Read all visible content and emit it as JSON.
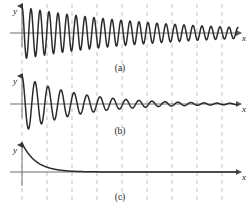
{
  "figure": {
    "width": 251,
    "height": 208,
    "background_color": "#ffffff",
    "curve_color": "#2b2b2b",
    "axis_color": "#4d4d4d",
    "grid_color": "#b9c6c6",
    "grid_dash": "4,4",
    "grid_x_positions": [
      22,
      47,
      72,
      97,
      122,
      147,
      172,
      197,
      222
    ],
    "grid_top": 4,
    "grid_bottom": 204
  },
  "labels": {
    "y_axis": "y",
    "x_axis": "x",
    "caption_a": "(a)",
    "caption_b": "(b)",
    "caption_c": "(c)"
  },
  "chart_data": {
    "type": "line",
    "xlabel": "x",
    "ylabel": "y",
    "grid": true,
    "legend": false,
    "panels": [
      {
        "id": "a",
        "caption": "(a)",
        "description": "lightly damped oscillation, slow exponential decay envelope",
        "baseline_y": 33,
        "x_start": 22,
        "x_end": 238,
        "amplitude": 26,
        "decay": 0.0072,
        "period_px": 9.0,
        "phase": 0,
        "xlim": [
          0,
          216
        ],
        "ylim": [
          -26,
          26
        ]
      },
      {
        "id": "b",
        "caption": "(b)",
        "description": "moderately damped oscillation, faster exponential decay envelope",
        "baseline_y": 104,
        "x_start": 22,
        "x_end": 238,
        "amplitude": 28,
        "decay": 0.0175,
        "period_px": 13.0,
        "phase": 0,
        "xlim": [
          0,
          216
        ],
        "ylim": [
          -28,
          28
        ]
      },
      {
        "id": "c",
        "caption": "(c)",
        "description": "overdamped, pure exponential decay with no oscillation",
        "baseline_y": 172,
        "x_start": 22,
        "x_end": 238,
        "amplitude": 29,
        "decay": 0.072,
        "period_px": 0,
        "phase": 0,
        "xlim": [
          0,
          216
        ],
        "ylim": [
          0,
          29
        ]
      }
    ],
    "axes": [
      {
        "panel": "a",
        "origin_x": 22,
        "baseline_y": 33,
        "y_top": 6,
        "x_right": 241
      },
      {
        "panel": "b",
        "origin_x": 22,
        "baseline_y": 104,
        "y_top": 76,
        "x_right": 241
      },
      {
        "panel": "c",
        "origin_x": 22,
        "baseline_y": 172,
        "y_top": 145,
        "x_right": 241
      }
    ],
    "caption_positions": [
      {
        "caption": "(a)",
        "x": 120,
        "y": 71
      },
      {
        "caption": "(b)",
        "x": 120,
        "y": 134
      },
      {
        "caption": "(c)",
        "x": 120,
        "y": 200
      }
    ],
    "y_label_positions": [
      {
        "x": 13,
        "y": 14
      },
      {
        "x": 13,
        "y": 84
      },
      {
        "x": 13,
        "y": 153
      }
    ],
    "x_label_positions": [
      {
        "x": 242,
        "y": 41
      },
      {
        "x": 242,
        "y": 112
      },
      {
        "x": 242,
        "y": 180
      }
    ]
  }
}
